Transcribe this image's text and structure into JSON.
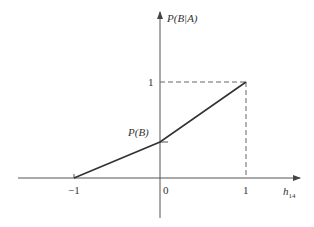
{
  "diagram": {
    "y_axis_label": "P(B|A)",
    "x_axis_label": "h",
    "x_axis_subscript": "14",
    "origin_label": "0",
    "x_tick_neg": "−1",
    "x_tick_pos": "1",
    "y_tick_one": "1",
    "y_intercept_label": "P(B)",
    "colors": {
      "axis": "#555555",
      "line": "#333333",
      "dashed": "#666666"
    },
    "points": [
      {
        "x": -1,
        "y": 0
      },
      {
        "x": 0,
        "y": "P(B)"
      },
      {
        "x": 1,
        "y": 1
      }
    ]
  }
}
